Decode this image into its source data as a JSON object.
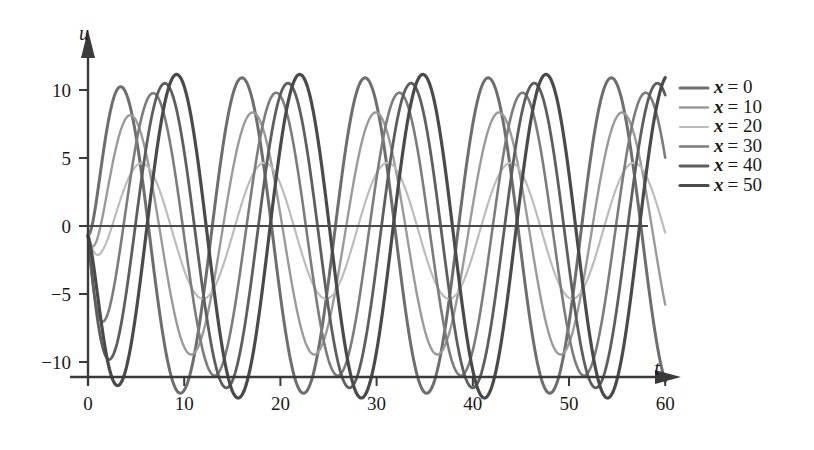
{
  "chart_data": {
    "type": "line",
    "title": "",
    "xlabel": "t",
    "ylabel": "u",
    "xlim": [
      0,
      62
    ],
    "ylim": [
      -13.5,
      12.0
    ],
    "xticks": [
      0,
      10,
      20,
      30,
      40,
      50,
      60
    ],
    "yticks": [
      10,
      5,
      0,
      -5,
      -10
    ],
    "xticklabels": [
      "0",
      "10",
      "20",
      "30",
      "40",
      "50",
      "60"
    ],
    "yticklabels": [
      "10",
      "5",
      "0",
      "-5",
      "-10"
    ],
    "grid": false,
    "legend_position": "right",
    "x_start": 0,
    "x_end": 60,
    "period": 12.8,
    "n_points": 600,
    "series": [
      {
        "name": "x = 0",
        "label_var": "x",
        "label_eq": "=",
        "label_value": "0",
        "amplitude": 11.6,
        "phase_shift": 0.0,
        "offset": -0.7,
        "color": "#6e6e6e",
        "width": 3.0
      },
      {
        "name": "x = 10",
        "label_var": "x",
        "label_eq": "=",
        "label_value": "10",
        "amplitude": 8.9,
        "phase_shift": 0.55,
        "offset": -0.55,
        "color": "#9a9a9a",
        "width": 2.4
      },
      {
        "name": "x = 20",
        "label_var": "x",
        "label_eq": "=",
        "label_value": "20",
        "amplitude": 5.0,
        "phase_shift": 1.15,
        "offset": -0.35,
        "color": "#bcbcbc",
        "width": 2.2
      },
      {
        "name": "x = 30",
        "label_var": "x",
        "label_eq": "=",
        "label_value": "30",
        "amplitude": 10.4,
        "phase_shift": 1.75,
        "offset": -0.6,
        "color": "#7c7c7c",
        "width": 2.6
      },
      {
        "name": "x = 40",
        "label_var": "x",
        "label_eq": "=",
        "label_value": "40",
        "amplitude": 11.2,
        "phase_shift": 2.35,
        "offset": -0.7,
        "color": "#5e5e5e",
        "width": 2.8
      },
      {
        "name": "x = 50",
        "label_var": "x",
        "label_eq": "=",
        "label_value": "50",
        "amplitude": 11.9,
        "phase_shift": 2.95,
        "offset": -0.75,
        "color": "#4a4a4a",
        "width": 3.2
      }
    ]
  },
  "figure": {
    "background_color": "#ffffff",
    "axis_color": "#3a3a3a",
    "text_color": "#1a1a1a",
    "x_axis_label": "t",
    "y_axis_label": "u"
  }
}
